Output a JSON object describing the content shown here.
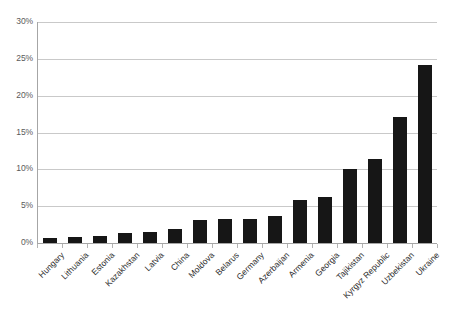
{
  "chart_data": {
    "type": "bar",
    "title": "",
    "subtitle": "",
    "xlabel": "",
    "ylabel": "",
    "ylim": [
      0,
      30
    ],
    "yunit": "%",
    "grid": true,
    "legend": false,
    "legend_position": "none",
    "bar_color": "#161616",
    "gridline_color": "#c9c9c9",
    "axis_color": "#a6a6a6",
    "ytick_labels": [
      "0%",
      "5%",
      "10%",
      "15%",
      "20%",
      "25%",
      "30%"
    ],
    "ytick_values": [
      0,
      5,
      10,
      15,
      20,
      25,
      30
    ],
    "categories": [
      "Hungary",
      "Lithuania",
      "Estonia",
      "Kazakhstan",
      "Latvia",
      "China",
      "Moldova",
      "Belarus",
      "Germany",
      "Azerbaijan",
      "Armenia",
      "Georgia",
      "Tajikistan",
      "Kyrgyz Republic",
      "Uzbekistan",
      "Ukraine"
    ],
    "values": [
      0.7,
      0.8,
      0.9,
      1.3,
      1.5,
      1.9,
      3.1,
      3.2,
      3.3,
      3.6,
      5.8,
      6.2,
      10.1,
      11.4,
      17.1,
      24.2
    ]
  }
}
